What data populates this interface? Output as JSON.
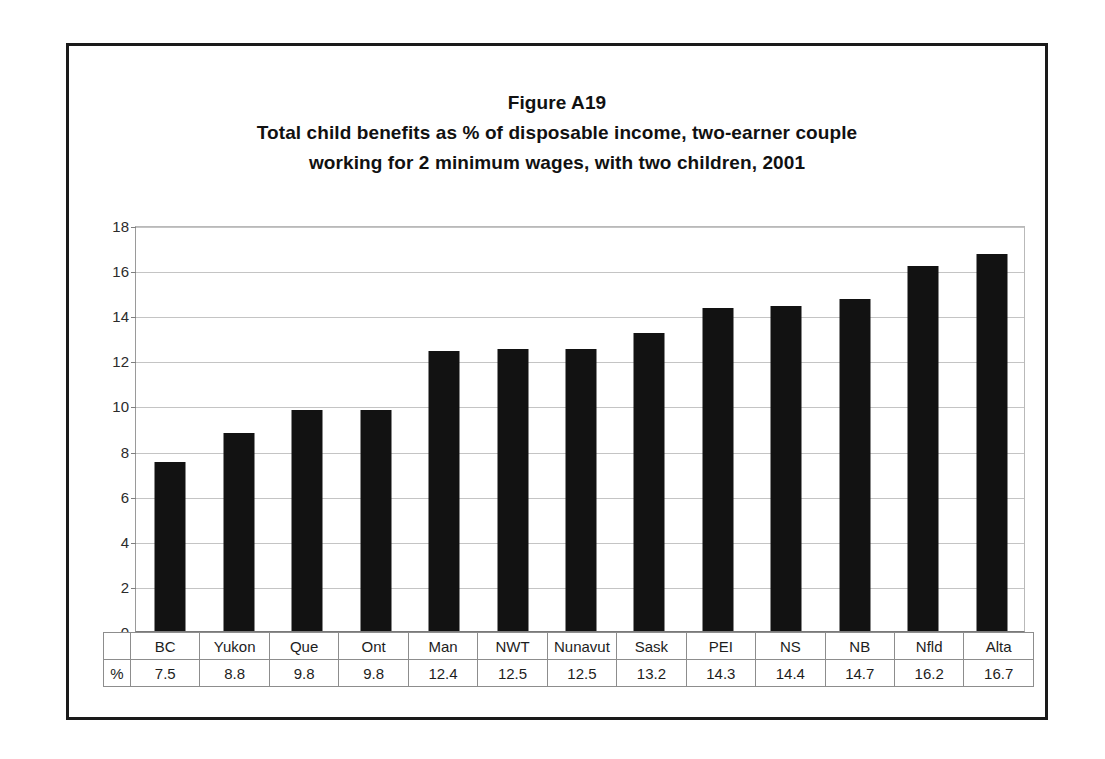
{
  "figure": {
    "title_line_1": "Figure A19",
    "title_line_2": "Total child benefits as % of disposable income, two-earner couple",
    "title_line_3": "working for 2 minimum wages, with two children, 2001",
    "unit_cell_label": "%",
    "colors": {
      "bar": "#121212",
      "gridline": "#c4c4c4",
      "frame": "#1a1a1a",
      "text": "#1d1d1d"
    }
  },
  "chart_data": {
    "type": "bar",
    "xlabel": "",
    "ylabel": "",
    "ylim": [
      0,
      18
    ],
    "yticks": [
      0,
      2,
      4,
      6,
      8,
      10,
      12,
      14,
      16,
      18
    ],
    "ytick_labels": [
      "0",
      "2",
      "4",
      "6",
      "8",
      "10",
      "12",
      "14",
      "16",
      "18"
    ],
    "grid": true,
    "legend": false,
    "categories": [
      "BC",
      "Yukon",
      "Que",
      "Ont",
      "Man",
      "NWT",
      "Nunavut",
      "Sask",
      "PEI",
      "NS",
      "NB",
      "Nfld",
      "Alta"
    ],
    "values": [
      7.5,
      8.8,
      9.8,
      9.8,
      12.4,
      12.5,
      12.5,
      13.2,
      14.3,
      14.4,
      14.7,
      16.2,
      16.7
    ],
    "value_labels": [
      "7.5",
      "8.8",
      "9.8",
      "9.8",
      "12.4",
      "12.5",
      "12.5",
      "13.2",
      "14.3",
      "14.4",
      "14.7",
      "16.2",
      "16.7"
    ]
  }
}
